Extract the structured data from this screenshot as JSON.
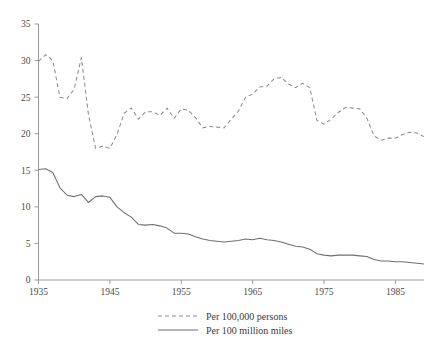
{
  "chart_data": {
    "type": "line",
    "title": "",
    "subtitle": "",
    "xlabel": "",
    "ylabel": "",
    "xlim": [
      1935,
      1989
    ],
    "ylim": [
      0,
      35
    ],
    "grid": false,
    "legend_position": "bottom-center",
    "x_ticks": [
      "1935",
      "1945",
      "1955",
      "1965",
      "1975",
      "1985"
    ],
    "x_tick_values": [
      1935,
      1945,
      1955,
      1965,
      1975,
      1985
    ],
    "y_ticks": [
      "0",
      "5",
      "10",
      "15",
      "20",
      "25",
      "30",
      "35"
    ],
    "y_tick_values": [
      0,
      5,
      10,
      15,
      20,
      25,
      30,
      35
    ],
    "x": [
      1935,
      1936,
      1937,
      1938,
      1939,
      1940,
      1941,
      1942,
      1943,
      1944,
      1945,
      1946,
      1947,
      1948,
      1949,
      1950,
      1951,
      1952,
      1953,
      1954,
      1955,
      1956,
      1957,
      1958,
      1959,
      1960,
      1961,
      1962,
      1963,
      1964,
      1965,
      1966,
      1967,
      1968,
      1969,
      1970,
      1971,
      1972,
      1973,
      1974,
      1975,
      1976,
      1977,
      1978,
      1979,
      1980,
      1981,
      1982,
      1983,
      1984,
      1985,
      1986,
      1987,
      1988,
      1989
    ],
    "series": [
      {
        "name": "Per 100,000 persons",
        "style": "dashed",
        "color": "#8d8d8d",
        "values": [
          29.9,
          30.8,
          30.0,
          25.0,
          24.8,
          26.1,
          30.4,
          22.6,
          18.0,
          18.3,
          18.0,
          19.9,
          22.8,
          23.5,
          22.0,
          23.0,
          23.0,
          22.5,
          23.5,
          22.1,
          23.4,
          23.2,
          22.2,
          20.8,
          21.0,
          20.9,
          20.8,
          22.0,
          23.1,
          25.0,
          25.4,
          26.4,
          26.5,
          27.5,
          27.7,
          26.8,
          26.3,
          26.9,
          26.3,
          21.8,
          21.3,
          22.0,
          22.9,
          23.6,
          23.5,
          23.4,
          22.1,
          19.7,
          19.1,
          19.4,
          19.4,
          19.9,
          20.2,
          20.1,
          19.6
        ]
      },
      {
        "name": "Per 100 million miles",
        "style": "solid",
        "color": "#6f6f6f",
        "values": [
          15.1,
          15.2,
          14.7,
          12.6,
          11.6,
          11.4,
          11.7,
          10.6,
          11.4,
          11.5,
          11.3,
          10.0,
          9.2,
          8.6,
          7.6,
          7.5,
          7.6,
          7.4,
          7.1,
          6.4,
          6.4,
          6.3,
          5.9,
          5.6,
          5.4,
          5.3,
          5.2,
          5.3,
          5.4,
          5.6,
          5.5,
          5.7,
          5.5,
          5.4,
          5.2,
          4.9,
          4.6,
          4.5,
          4.2,
          3.6,
          3.4,
          3.3,
          3.4,
          3.4,
          3.4,
          3.3,
          3.2,
          2.8,
          2.6,
          2.6,
          2.5,
          2.5,
          2.4,
          2.3,
          2.2
        ]
      }
    ],
    "legend": [
      {
        "label": "Per 100,000 persons",
        "style": "dashed"
      },
      {
        "label": "Per 100 million miles",
        "style": "solid"
      }
    ]
  }
}
